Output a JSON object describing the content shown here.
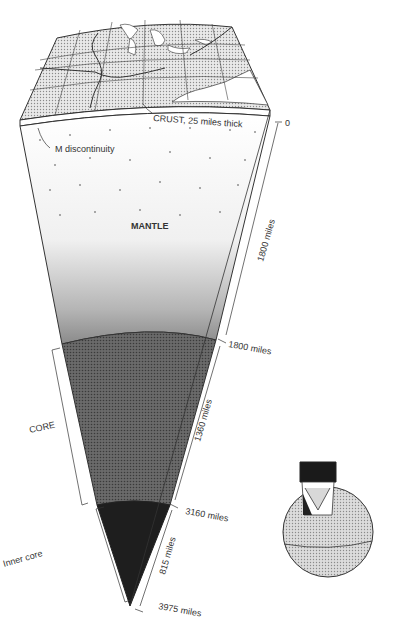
{
  "diagram": {
    "labels": {
      "crust": "CRUST, 25 miles thick",
      "m_discontinuity": "M discontinuity",
      "mantle": "MANTLE",
      "core": "CORE",
      "inner_core": "Inner core"
    },
    "depths": {
      "surface": "0",
      "mantle_thickness": "1800 miles",
      "mantle_base": "1800 miles",
      "outer_core_thickness": "1360 miles",
      "inner_core_top": "3160 miles",
      "inner_core_thickness": "815 miles",
      "center": "3975 miles"
    },
    "inset": {
      "description": "Globe with wedge cutaway showing location of section"
    }
  }
}
